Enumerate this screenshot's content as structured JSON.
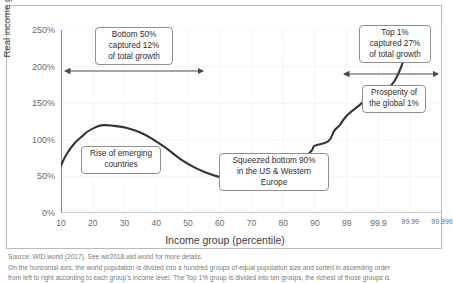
{
  "chart_data": {
    "type": "line",
    "title": "",
    "xlabel": "Income group (percentile)",
    "ylabel": "Real income growth per adult (%)",
    "x_tick_labels": [
      "10",
      "20",
      "30",
      "40",
      "50",
      "60",
      "70",
      "80",
      "90",
      "99",
      "99.9",
      "99.99",
      "99.999"
    ],
    "y_tick_labels": [
      "0%",
      "50%",
      "100%",
      "150%",
      "200%",
      "250%"
    ],
    "y_tick_values": [
      0,
      50,
      100,
      150,
      200,
      250
    ],
    "ylim": [
      0,
      250
    ],
    "grid": true,
    "legend": "none",
    "series": [
      {
        "name": "Total income growth per adult (1980-2016)",
        "color": "#333333",
        "points": [
          {
            "x": "10",
            "slot": 0.0,
            "y": 65
          },
          {
            "x": "12",
            "slot": 0.17,
            "y": 80
          },
          {
            "x": "15",
            "slot": 0.42,
            "y": 95
          },
          {
            "x": "18",
            "slot": 0.67,
            "y": 105
          },
          {
            "x": "20",
            "slot": 0.83,
            "y": 111
          },
          {
            "x": "23",
            "slot": 1.08,
            "y": 117
          },
          {
            "x": "26",
            "slot": 1.33,
            "y": 120
          },
          {
            "x": "30",
            "slot": 1.67,
            "y": 119
          },
          {
            "x": "35",
            "slot": 2.08,
            "y": 116
          },
          {
            "x": "40",
            "slot": 2.5,
            "y": 110
          },
          {
            "x": "45",
            "slot": 2.92,
            "y": 100
          },
          {
            "x": "50",
            "slot": 3.33,
            "y": 88
          },
          {
            "x": "55",
            "slot": 3.75,
            "y": 74
          },
          {
            "x": "60",
            "slot": 4.17,
            "y": 63
          },
          {
            "x": "65",
            "slot": 4.58,
            "y": 55
          },
          {
            "x": "70",
            "slot": 5.0,
            "y": 49
          },
          {
            "x": "75",
            "slot": 5.42,
            "y": 45
          },
          {
            "x": "80",
            "slot": 5.83,
            "y": 44
          },
          {
            "x": "85",
            "slot": 6.25,
            "y": 44
          },
          {
            "x": "88",
            "slot": 6.5,
            "y": 44
          },
          {
            "x": "90",
            "slot": 6.67,
            "y": 45
          },
          {
            "x": "92",
            "slot": 6.92,
            "y": 54
          },
          {
            "x": "94",
            "slot": 7.17,
            "y": 66
          },
          {
            "x": "95",
            "slot": 7.33,
            "y": 69
          },
          {
            "x": "96",
            "slot": 7.58,
            "y": 72
          },
          {
            "x": "97",
            "slot": 7.75,
            "y": 78
          },
          {
            "x": "98",
            "slot": 7.92,
            "y": 87
          },
          {
            "x": "99",
            "slot": 8.0,
            "y": 92
          },
          {
            "x": "99.3",
            "slot": 8.42,
            "y": 98
          },
          {
            "x": "99.5",
            "slot": 8.6,
            "y": 112
          },
          {
            "x": "99.7",
            "slot": 8.78,
            "y": 120
          },
          {
            "x": "99.9",
            "slot": 9.0,
            "y": 133
          },
          {
            "x": "99.95",
            "slot": 9.42,
            "y": 148
          },
          {
            "x": "99.99",
            "slot": 10.0,
            "y": 170
          },
          {
            "x": "99.995",
            "slot": 10.5,
            "y": 180
          },
          {
            "x": "99.999",
            "slot": 11.0,
            "y": 235
          }
        ]
      }
    ],
    "annotations": [
      {
        "id": "bottom-50-callout",
        "text": "Bottom 50%\ncaptured 12%\nof total growth",
        "left": 88,
        "top": 21,
        "width": 78,
        "height": 36
      },
      {
        "id": "rise-emerging-callout",
        "text": "Rise of emerging\ncountries",
        "left": 74,
        "top": 140,
        "width": 80,
        "height": 26
      },
      {
        "id": "squeezed-bottom-90-callout",
        "text": "Squeezed bottom 90%\nin the US & Western Europe",
        "left": 212,
        "top": 147,
        "width": 110,
        "height": 26
      },
      {
        "id": "top-1-callout",
        "text": "Top 1%\ncaptured 27%\nof total growth",
        "left": 352,
        "top": 19,
        "width": 72,
        "height": 36
      },
      {
        "id": "prosperity-global-1-callout",
        "text": "Prosperity of\nthe global 1%",
        "left": 355,
        "top": 79,
        "width": 64,
        "height": 26
      }
    ],
    "arrows": [
      {
        "id": "bottom-50-arrow",
        "x1": 55,
        "x2": 199,
        "y": 65,
        "label": "Bottom 50% span"
      },
      {
        "id": "top-1-arrow",
        "x1": 334,
        "x2": 434,
        "y": 68,
        "label": "Top 1% span"
      }
    ]
  },
  "footnotes": {
    "source": "Source: WID.world (2017). See wir2018.wid.world for more details.",
    "note_line_1": "On the horizontal axis, the world population is divided into a hundred groups of equal population size and sorted in ascending order",
    "note_line_2": "from left to right according to each group's income level. The Top 1% group is divided into ten groups, the richest of those groups is"
  }
}
